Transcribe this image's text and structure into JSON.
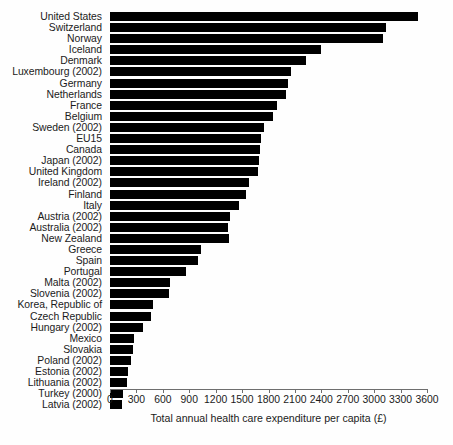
{
  "chart_data": {
    "type": "bar",
    "orientation": "horizontal",
    "title": "",
    "xlabel": "Total annual health care expenditure per capita (£)",
    "ylabel": "",
    "xlim": [
      0,
      3600
    ],
    "xticks": [
      0,
      300,
      600,
      900,
      1200,
      1500,
      1800,
      2100,
      2400,
      2700,
      3000,
      3300,
      3600
    ],
    "xtick_labels": [
      "0",
      "300",
      "600",
      "900",
      "1200",
      "1500",
      "1800",
      "2100",
      "2400",
      "2700",
      "3000",
      "3300",
      "3600"
    ],
    "grid": false,
    "legend": null,
    "bar_color": "#000000",
    "categories": [
      "United States",
      "Switzerland",
      "Norway",
      "Iceland",
      "Denmark",
      "Luxembourg (2002)",
      "Germany",
      "Netherlands",
      "France",
      "Belgium",
      "Sweden (2002)",
      "EU15",
      "Canada",
      "Japan (2002)",
      "United Kingdom",
      "Ireland (2002)",
      "Finland",
      "Italy",
      "Austria (2002)",
      "Australia (2002)",
      "New Zealand",
      "Greece",
      "Spain",
      "Portugal",
      "Malta (2002)",
      "Slovenia (2002)",
      "Korea, Republic of",
      "Czech Republic",
      "Hungary (2002)",
      "Mexico",
      "Slovakia",
      "Poland (2002)",
      "Estonia (2002)",
      "Lithuania (2002)",
      "Turkey (2000)",
      "Latvia (2002)"
    ],
    "values": [
      3500,
      3140,
      3100,
      2400,
      2230,
      2060,
      2020,
      2000,
      1900,
      1855,
      1750,
      1720,
      1700,
      1695,
      1685,
      1580,
      1545,
      1470,
      1360,
      1345,
      1350,
      1035,
      1000,
      865,
      685,
      670,
      490,
      465,
      380,
      275,
      265,
      235,
      200,
      195,
      150,
      135
    ]
  }
}
